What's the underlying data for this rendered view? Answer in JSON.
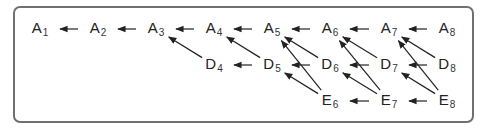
{
  "diagram": {
    "frame_color": "#707070",
    "edge_color": "#222222",
    "nodes": [
      {
        "id": "A1",
        "letter": "A",
        "sub": "1",
        "x": 40,
        "y": 29
      },
      {
        "id": "A2",
        "letter": "A",
        "sub": "2",
        "x": 98,
        "y": 29
      },
      {
        "id": "A3",
        "letter": "A",
        "sub": "3",
        "x": 156,
        "y": 29
      },
      {
        "id": "A4",
        "letter": "A",
        "sub": "4",
        "x": 214,
        "y": 29
      },
      {
        "id": "A5",
        "letter": "A",
        "sub": "5",
        "x": 272,
        "y": 29
      },
      {
        "id": "A6",
        "letter": "A",
        "sub": "6",
        "x": 330,
        "y": 29
      },
      {
        "id": "A7",
        "letter": "A",
        "sub": "7",
        "x": 389,
        "y": 29
      },
      {
        "id": "A8",
        "letter": "A",
        "sub": "8",
        "x": 447,
        "y": 29
      },
      {
        "id": "D4",
        "letter": "D",
        "sub": "4",
        "x": 214,
        "y": 65
      },
      {
        "id": "D5",
        "letter": "D",
        "sub": "5",
        "x": 272,
        "y": 65
      },
      {
        "id": "D6",
        "letter": "D",
        "sub": "6",
        "x": 330,
        "y": 65
      },
      {
        "id": "D7",
        "letter": "D",
        "sub": "7",
        "x": 389,
        "y": 65
      },
      {
        "id": "D8",
        "letter": "D",
        "sub": "8",
        "x": 447,
        "y": 65
      },
      {
        "id": "E6",
        "letter": "E",
        "sub": "6",
        "x": 330,
        "y": 101
      },
      {
        "id": "E7",
        "letter": "E",
        "sub": "7",
        "x": 389,
        "y": 101
      },
      {
        "id": "E8",
        "letter": "E",
        "sub": "8",
        "x": 447,
        "y": 101
      }
    ],
    "edges": [
      [
        "A2",
        "A1"
      ],
      [
        "A3",
        "A2"
      ],
      [
        "A4",
        "A3"
      ],
      [
        "A5",
        "A4"
      ],
      [
        "A6",
        "A5"
      ],
      [
        "A7",
        "A6"
      ],
      [
        "A8",
        "A7"
      ],
      [
        "D5",
        "D4"
      ],
      [
        "D6",
        "D5"
      ],
      [
        "D7",
        "D6"
      ],
      [
        "D8",
        "D7"
      ],
      [
        "D4",
        "A3"
      ],
      [
        "D5",
        "A4"
      ],
      [
        "D6",
        "A5"
      ],
      [
        "D7",
        "A6"
      ],
      [
        "D8",
        "A7"
      ],
      [
        "E7",
        "E6"
      ],
      [
        "E8",
        "E7"
      ],
      [
        "E6",
        "D5"
      ],
      [
        "E7",
        "D6"
      ],
      [
        "E8",
        "D7"
      ],
      [
        "E6",
        "A5"
      ],
      [
        "E7",
        "A6"
      ],
      [
        "E8",
        "A7"
      ]
    ]
  }
}
